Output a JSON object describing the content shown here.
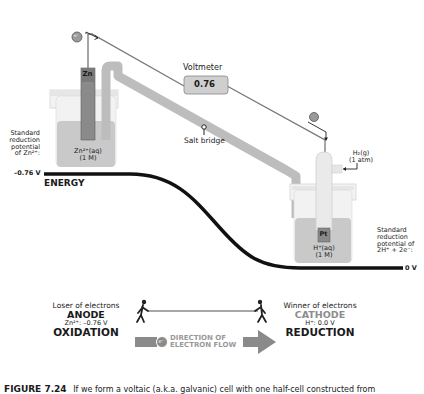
{
  "diagram": {
    "voltmeter": {
      "label": "Voltmeter",
      "value": "0.76"
    },
    "salt_bridge": {
      "label": "Salt bridge"
    },
    "anode_cell": {
      "electrode": "Zn",
      "solution_line1": "Zn²⁺(aq)",
      "solution_line2": "(1 M)"
    },
    "cathode_cell": {
      "electrode": "Pt",
      "solution_line1": "H⁺(aq)",
      "solution_line2": "(1 M)",
      "gas_line1": "H₂(g)",
      "gas_line2": "(1 atm)"
    },
    "left_potential": {
      "lines": [
        "Standard",
        "reduction",
        "potential",
        "of Zn²⁺:"
      ],
      "value": "–0.76 V"
    },
    "right_potential": {
      "lines": [
        "Standard",
        "reduction",
        "potential of",
        "2H⁺ + 2e⁻:"
      ],
      "value": "0 V"
    },
    "energy_label": "ENERGY",
    "electron_symbol": "e⁻",
    "legend": {
      "anode": {
        "role": "Loser of electrons",
        "name": "ANODE",
        "potential": "Zn²⁺: –0.76 V",
        "process": "OXIDATION"
      },
      "cathode": {
        "role": "Winner of electrons",
        "name": "CATHODE",
        "potential": "H⁺: 0.0 V",
        "process": "REDUCTION"
      },
      "flow_line1": "DIRECTION OF",
      "flow_line2": "ELECTRON FLOW"
    },
    "caption": {
      "label": "FIGURE 7.24",
      "text": "If we form a voltaic (a.k.a. galvanic) cell with one half-cell constructed from"
    },
    "colors": {
      "solution": "#c9c9c9",
      "bridge": "#bdbdbd",
      "electrode": "#8a8a8a",
      "curve": "#111111",
      "cathode_text": "#8c8c8c",
      "flow_text": "#9a9a9a"
    }
  }
}
